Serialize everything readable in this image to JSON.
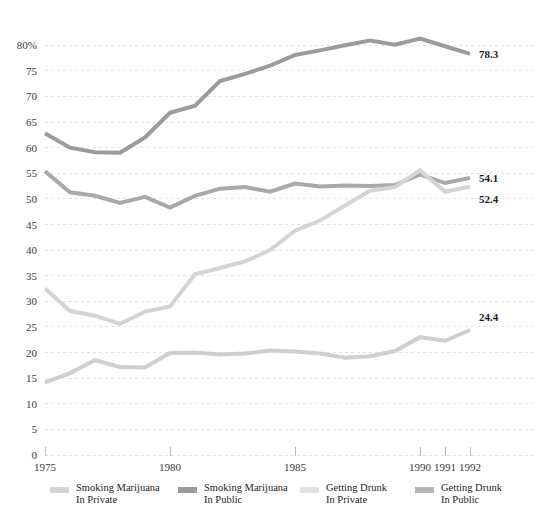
{
  "chart_data": {
    "type": "line",
    "title": "",
    "subtitle": "",
    "xlabel": "",
    "ylabel": "",
    "ylim": [
      0,
      82
    ],
    "xlim": [
      1975,
      1992
    ],
    "grid": true,
    "legend_position": "bottom",
    "y_ticks": [
      0,
      5,
      10,
      15,
      20,
      25,
      30,
      35,
      40,
      45,
      50,
      55,
      60,
      65,
      70,
      75,
      80
    ],
    "y_tick_labels": [
      "0",
      "5",
      "10",
      "15",
      "20",
      "25",
      "30",
      "35",
      "40",
      "45",
      "50",
      "55",
      "60",
      "65",
      "70",
      "75",
      "80%"
    ],
    "x": [
      1975,
      1976,
      1977,
      1978,
      1979,
      1980,
      1981,
      1982,
      1983,
      1984,
      1985,
      1986,
      1987,
      1988,
      1989,
      1990,
      1991,
      1992
    ],
    "x_ticks": [
      1975,
      1980,
      1985,
      1990,
      1991,
      1992
    ],
    "x_tick_labels": [
      "1975",
      "1980",
      "1985",
      "1990",
      "1991",
      "1992"
    ],
    "series": [
      {
        "name": "Smoking Marijuana In Public",
        "color": "#9b9b9b",
        "end_label": "78.3",
        "values": [
          62.8,
          60.0,
          59.1,
          59.0,
          62.0,
          66.8,
          68.2,
          73.0,
          74.4,
          76.0,
          78.1,
          79.0,
          80.0,
          80.9,
          80.1,
          81.3,
          79.8,
          78.3
        ]
      },
      {
        "name": "Getting Drunk In Public",
        "color": "#a9a9a9",
        "end_label": "54.1",
        "values": [
          55.4,
          51.3,
          50.6,
          49.2,
          50.4,
          48.3,
          50.6,
          52.0,
          52.3,
          51.4,
          53.0,
          52.4,
          52.6,
          52.5,
          52.7,
          54.8,
          53.1,
          54.1
        ]
      },
      {
        "name": "Smoking Marijuana In Private",
        "color": "#d4d4d4",
        "end_label": "52.4",
        "values": [
          32.5,
          28.1,
          27.2,
          25.6,
          28.0,
          29.0,
          35.3,
          36.5,
          37.8,
          40.0,
          43.8,
          45.8,
          48.7,
          51.6,
          52.3,
          55.6,
          51.4,
          52.4
        ]
      },
      {
        "name": "Getting Drunk In Private",
        "color": "#cfcfcf",
        "end_label": "24.4",
        "values": [
          14.2,
          16.0,
          18.5,
          17.2,
          17.1,
          19.9,
          20.0,
          19.6,
          19.8,
          20.4,
          20.2,
          19.8,
          19.0,
          19.3,
          20.3,
          23.0,
          22.3,
          24.4
        ]
      }
    ]
  },
  "legend": {
    "items": [
      {
        "line1": "Smoking Marijuana",
        "line2": "In Private",
        "color": "#d4d4d4",
        "swatch": "legend-swatch-smoking-private"
      },
      {
        "line1": "Smoking Marijuana",
        "line2": "In Public",
        "color": "#9b9b9b",
        "swatch": "legend-swatch-smoking-public"
      },
      {
        "line1": "Getting Drunk",
        "line2": "In Private",
        "color": "#e2e2e2",
        "swatch": "legend-swatch-drunk-private"
      },
      {
        "line1": "Getting Drunk",
        "line2": "In Public",
        "color": "#b5b5b5",
        "swatch": "legend-swatch-drunk-public"
      }
    ]
  },
  "axes": {
    "y_axis_top_label": "80%",
    "x_first": "1975",
    "x_last": "1992"
  },
  "colors": {
    "background": "#ffffff",
    "gridline": "#e3e3e3",
    "text": "#231f20"
  }
}
